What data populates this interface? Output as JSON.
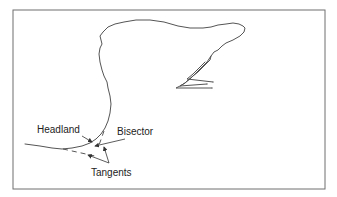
{
  "figure": {
    "labels": {
      "headland": "Headland",
      "bisector": "Bisector",
      "tangents": "Tangents"
    },
    "colors": {
      "background": "#ffffff",
      "frame": "#6f6f6f",
      "coastline": "#555555",
      "text": "#222222"
    }
  }
}
